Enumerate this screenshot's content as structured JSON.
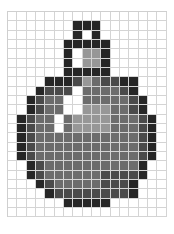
{
  "grid": {
    "columns": 17,
    "rows": 22,
    "palette": {
      "0": "#ffffff",
      "1": "#262626",
      "2": "#4a4a4a",
      "3": "#6c6c6c",
      "4": "#979797"
    },
    "cells": [
      "00000000000000000",
      "00000001110000000",
      "00000001010000000",
      "00000011111000000",
      "00000010441000000",
      "00000010441000000",
      "00000011111000000",
      "00001112432211000",
      "00012220333321000",
      "00123300333332100",
      "00123300444332100",
      "01233034444333210",
      "01233034444333210",
      "01233333333333210",
      "01233333333333210",
      "01233333333333210",
      "00123333333333100",
      "00123333332222100",
      "00012333332221000",
      "00001222222221000",
      "00000011111000000",
      "00000000000000000"
    ]
  }
}
